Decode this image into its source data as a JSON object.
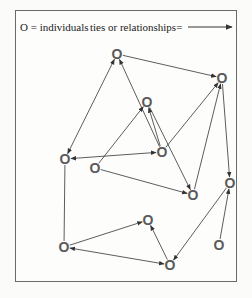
{
  "legend": {
    "nodes_label": "O = individuals",
    "edges_label": "ties or relationships="
  },
  "colors": {
    "edge": "#333333",
    "node": "#5a5a5a",
    "frame": "#6a6a6a"
  },
  "nodes": [
    {
      "id": "A",
      "label": "O",
      "x": 117,
      "y": 54
    },
    {
      "id": "B",
      "label": "O",
      "x": 222,
      "y": 78
    },
    {
      "id": "C",
      "label": "O",
      "x": 147,
      "y": 102
    },
    {
      "id": "D",
      "label": "O",
      "x": 65,
      "y": 159
    },
    {
      "id": "E",
      "label": "O",
      "x": 95,
      "y": 168
    },
    {
      "id": "F",
      "label": "O",
      "x": 162,
      "y": 152
    },
    {
      "id": "G",
      "label": "O",
      "x": 193,
      "y": 195
    },
    {
      "id": "H",
      "label": "O",
      "x": 230,
      "y": 183
    },
    {
      "id": "I",
      "label": "O",
      "x": 148,
      "y": 220
    },
    {
      "id": "J",
      "label": "O",
      "x": 64,
      "y": 247
    },
    {
      "id": "K",
      "label": "O",
      "x": 170,
      "y": 265
    },
    {
      "id": "L",
      "label": "O",
      "x": 219,
      "y": 245
    }
  ],
  "edges": [
    {
      "from": "A",
      "to": "B",
      "dir": "to"
    },
    {
      "from": "A",
      "to": "D",
      "dir": "both"
    },
    {
      "from": "F",
      "to": "A",
      "dir": "to"
    },
    {
      "from": "E",
      "to": "C",
      "dir": "to"
    },
    {
      "from": "C",
      "to": "G",
      "dir": "to"
    },
    {
      "from": "F",
      "to": "C",
      "dir": "to"
    },
    {
      "from": "F",
      "to": "B",
      "dir": "to"
    },
    {
      "from": "D",
      "to": "F",
      "dir": "both"
    },
    {
      "from": "E",
      "to": "G",
      "dir": "to"
    },
    {
      "from": "G",
      "to": "B",
      "dir": "to"
    },
    {
      "from": "B",
      "to": "H",
      "dir": "to"
    },
    {
      "from": "H",
      "to": "K",
      "dir": "to"
    },
    {
      "from": "L",
      "to": "H",
      "dir": "to"
    },
    {
      "from": "J",
      "to": "D",
      "dir": "none"
    },
    {
      "from": "J",
      "to": "I",
      "dir": "to"
    },
    {
      "from": "K",
      "to": "J",
      "dir": "both"
    },
    {
      "from": "K",
      "to": "I",
      "dir": "to"
    }
  ]
}
